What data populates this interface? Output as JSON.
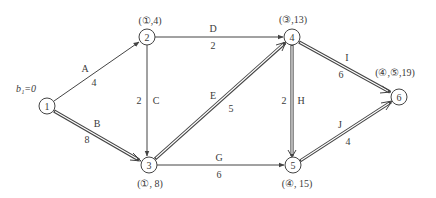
{
  "diagram": {
    "type": "network-shortest-path",
    "start_label": "b₁=0",
    "nodes": [
      {
        "id": "1",
        "label": "1",
        "x": 47,
        "y": 106,
        "annotation": ""
      },
      {
        "id": "2",
        "label": "2",
        "x": 147,
        "y": 37,
        "annotation": "(①,4)"
      },
      {
        "id": "3",
        "label": "3",
        "x": 149,
        "y": 165,
        "annotation": "(①, 8)"
      },
      {
        "id": "4",
        "label": "4",
        "x": 292,
        "y": 37,
        "annotation": "(③,13)"
      },
      {
        "id": "5",
        "label": "5",
        "x": 293,
        "y": 165,
        "annotation": "(④, 15)"
      },
      {
        "id": "6",
        "label": "6",
        "x": 399,
        "y": 97,
        "annotation": "(④,⑤,19)"
      }
    ],
    "edges": [
      {
        "name": "A",
        "from": "1",
        "to": "2",
        "weight": "4",
        "critical": false
      },
      {
        "name": "B",
        "from": "1",
        "to": "3",
        "weight": "8",
        "critical": true
      },
      {
        "name": "C",
        "from": "2",
        "to": "3",
        "weight": "2",
        "critical": false
      },
      {
        "name": "D",
        "from": "2",
        "to": "4",
        "weight": "2",
        "critical": false
      },
      {
        "name": "E",
        "from": "3",
        "to": "4",
        "weight": "5",
        "critical": true
      },
      {
        "name": "G",
        "from": "3",
        "to": "5",
        "weight": "6",
        "critical": false
      },
      {
        "name": "H",
        "from": "4",
        "to": "5",
        "weight": "2",
        "critical": true
      },
      {
        "name": "I",
        "from": "4",
        "to": "6",
        "weight": "6",
        "critical": true
      },
      {
        "name": "J",
        "from": "5",
        "to": "6",
        "weight": "4",
        "critical": true
      }
    ]
  }
}
